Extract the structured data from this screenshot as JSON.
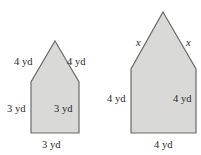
{
  "colors": {
    "fill": "#d9d9d7",
    "stroke": "#6a6a6a",
    "text": "#2a2a2a"
  },
  "figures": [
    {
      "name": "small-pentagon",
      "labels": {
        "left_roof": "4 yd",
        "right_roof": "4 yd",
        "left_wall": "3 yd",
        "right_wall": "3 yd",
        "base": "3 yd"
      }
    },
    {
      "name": "large-pentagon",
      "labels": {
        "left_roof": "x",
        "right_roof": "x",
        "left_wall": "4 yd",
        "right_wall": "4 yd",
        "base": "4 yd"
      }
    }
  ]
}
